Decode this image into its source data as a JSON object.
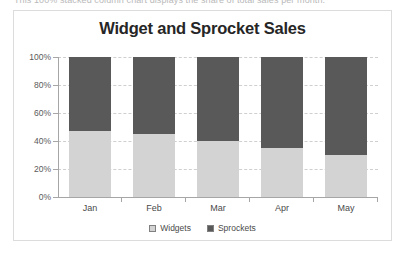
{
  "document": {
    "cutoff_text_line": "This 100% stacked column chart displays the share of total sales per month."
  },
  "chart": {
    "title": "Widget and Sprocket Sales",
    "colors": {
      "widgets": "#D3D3D3",
      "sprockets": "#595959",
      "gridline": "#CFCFCF",
      "axis": "#A6A6A6",
      "title_text": "#262626",
      "label_text": "#4A4A4A",
      "frame_border": "#DCDCDC"
    }
  },
  "chart_data": {
    "type": "bar",
    "stacked": true,
    "normalized_100_percent": true,
    "title": "Widget and Sprocket Sales",
    "xlabel": "",
    "ylabel": "",
    "categories": [
      "Jan",
      "Feb",
      "Mar",
      "Apr",
      "May"
    ],
    "series": [
      {
        "name": "Widgets",
        "color": "#D3D3D3",
        "values": [
          47,
          45,
          40,
          35,
          30
        ]
      },
      {
        "name": "Sprockets",
        "color": "#595959",
        "values": [
          53,
          55,
          60,
          65,
          70
        ]
      }
    ],
    "ylim": [
      0,
      100
    ],
    "ytick_labels": [
      "0%",
      "20%",
      "40%",
      "60%",
      "80%",
      "100%"
    ],
    "ytick_values": [
      0,
      20,
      40,
      60,
      80,
      100
    ],
    "grid": true,
    "grid_style": "dashed-horizontal",
    "legend": [
      "Widgets",
      "Sprockets"
    ],
    "legend_position": "bottom"
  }
}
